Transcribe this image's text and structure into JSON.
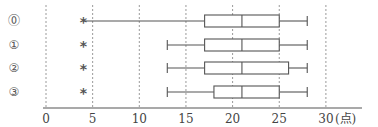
{
  "chart_data": {
    "type": "boxplot",
    "title": "",
    "xlabel": "",
    "unit_label": "(点)",
    "orientation": "horizontal",
    "xlim": [
      0,
      30
    ],
    "x_ticks": [
      0,
      5,
      10,
      15,
      20,
      25,
      30
    ],
    "x_tick_labels": [
      "0",
      "5",
      "10",
      "15",
      "20",
      "25",
      "30"
    ],
    "grid": "vertical dashed at each tick",
    "series": [
      {
        "name": "⓪",
        "min": 4,
        "q1": 17,
        "median": 21,
        "q3": 25,
        "max": 28,
        "outliers": [],
        "marker_at": 4
      },
      {
        "name": "①",
        "min": 13,
        "q1": 17,
        "median": 21,
        "q3": 25,
        "max": 28,
        "outliers": [
          4
        ]
      },
      {
        "name": "②",
        "min": 13,
        "q1": 17,
        "median": 21,
        "q3": 26,
        "max": 28,
        "outliers": [
          4
        ]
      },
      {
        "name": "③",
        "min": 13,
        "q1": 18,
        "median": 21,
        "q3": 25,
        "max": 28,
        "outliers": [
          4
        ]
      }
    ],
    "marker_symbol": "*"
  },
  "layout": {
    "x0_px": 46,
    "px_per_unit": 9.33,
    "row_y_px": [
      21,
      45,
      68,
      92
    ],
    "box_half_height": 6,
    "axis_y_px": 108,
    "grid_top_px": 5
  }
}
